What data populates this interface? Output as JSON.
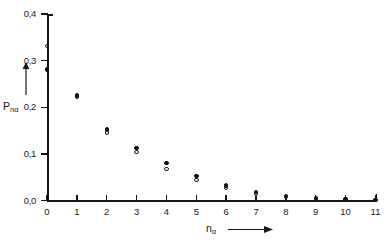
{
  "chart_data": {
    "type": "scatter",
    "title": "",
    "xlabel": "nα",
    "ylabel": "Pnα",
    "x": [
      0,
      1,
      2,
      3,
      4,
      5,
      6,
      7,
      8,
      9,
      10,
      11
    ],
    "xlim": [
      0,
      11
    ],
    "ylim": [
      0.0,
      0.4
    ],
    "xticks": [
      "0",
      "1",
      "2",
      "3",
      "4",
      "5",
      "6",
      "7",
      "8",
      "9",
      "10",
      "11"
    ],
    "yticks": [
      "0,0",
      "0,1",
      "0,2",
      "0,3",
      "0,4"
    ],
    "ytick_values": [
      0.0,
      0.1,
      0.2,
      0.3,
      0.4
    ],
    "grid": false,
    "legend": false,
    "series": [
      {
        "name": "filled",
        "marker": "filled-circle",
        "color": "#101010",
        "values": [
          0.281,
          0.225,
          0.152,
          0.113,
          0.08,
          0.053,
          0.032,
          0.018,
          0.009,
          0.005,
          0.003,
          0.001
        ]
      },
      {
        "name": "open",
        "marker": "open-circle",
        "color": "#1a1a1a",
        "values": [
          0.332,
          0.222,
          0.146,
          0.104,
          0.067,
          0.044,
          0.027,
          0.015,
          0.007,
          0.004,
          0.002,
          0.001
        ]
      }
    ]
  },
  "axes": {
    "y_label_main": "P",
    "y_label_sub": "nα",
    "x_label_main": "n",
    "x_label_sub": "α",
    "y_arrow_name": "y-axis-arrow",
    "x_arrow_name": "x-axis-arrow"
  }
}
